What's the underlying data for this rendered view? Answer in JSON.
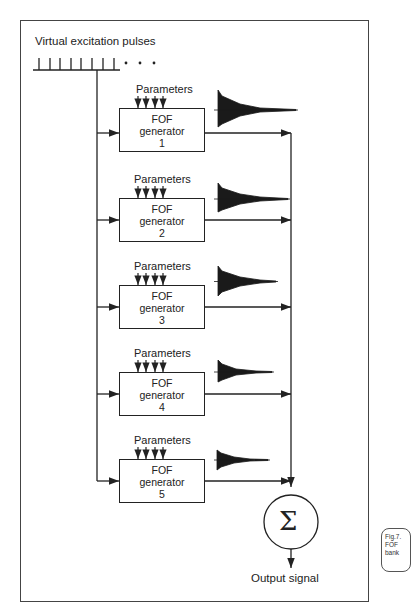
{
  "diagram": {
    "title_input": "Virtual excitation pulses",
    "ellipsis": ". . .",
    "generators": [
      {
        "params_label": "Parameters",
        "line1": "FOF",
        "line2": "generator",
        "number": "1"
      },
      {
        "params_label": "Parameters",
        "line1": "FOF",
        "line2": "generator",
        "number": "2"
      },
      {
        "params_label": "Parameters",
        "line1": "FOF",
        "line2": "generator",
        "number": "3"
      },
      {
        "params_label": "Parameters",
        "line1": "FOF",
        "line2": "generator",
        "number": "4"
      },
      {
        "params_label": "Parameters",
        "line1": "FOF",
        "line2": "generator",
        "number": "5"
      }
    ],
    "sum_symbol": "Σ",
    "output_label": "Output signal",
    "caption": {
      "line1": "Fig.7.",
      "line2": "FOF",
      "line3": "bank"
    }
  }
}
